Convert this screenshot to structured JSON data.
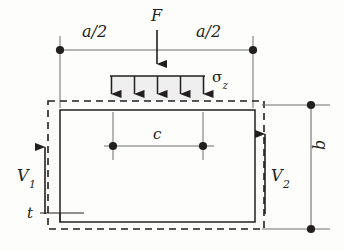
{
  "diagram": {
    "colors": {
      "line": "#231f20",
      "thin_line": "#6d6e71",
      "load_fill": "#efefef",
      "background": "#fdfdfb"
    },
    "labels": {
      "dim_a_left": "a/2",
      "dim_a_right": "a/2",
      "force_F": "F",
      "stress_sigma": "σ",
      "stress_sigma_sub": "z",
      "dim_c": "c",
      "shear_V1": "V",
      "shear_V1_sub": "1",
      "thickness_t": "t",
      "shear_V2": "V",
      "shear_V2_sub": "2",
      "dim_b": "b"
    },
    "geometry": {
      "top_dim_line_y": 50,
      "top_dim_left_x": 60,
      "top_dim_right_x": 253,
      "force_arrow_x": 157,
      "force_arrow_top": 30,
      "force_arrow_bottom": 72,
      "load_block_left": 110,
      "load_block_right": 205,
      "load_block_top": 76,
      "load_block_bottom": 101,
      "load_arrow_count": 5,
      "dashed_rect": {
        "x": 48,
        "y": 101,
        "w": 216,
        "h": 128
      },
      "solid_rect": {
        "x": 60,
        "y": 110,
        "w": 195,
        "h": 112
      },
      "c_dim_y": 146,
      "c_dim_left_x": 113,
      "c_dim_right_x": 203,
      "b_dim_line_x": 311,
      "b_dim_top_y": 105,
      "b_dim_bottom_y": 229,
      "v1_arrow_x": 45,
      "v2_arrow_x": 265
    }
  }
}
